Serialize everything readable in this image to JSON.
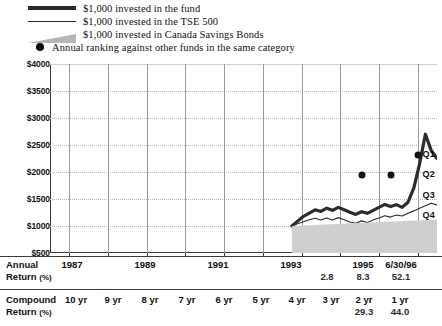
{
  "legend": {
    "items": [
      {
        "icon": "thick-line-swatch",
        "label": "$1,000 invested in the fund"
      },
      {
        "icon": "thin-line-swatch",
        "label": "$1,000 invested in the TSE 500"
      },
      {
        "icon": "gray-wedge-swatch",
        "label": "$1,000 invested in Canada Savings Bonds"
      },
      {
        "icon": "black-dot-swatch",
        "label": "Annual ranking against other funds in the same category"
      }
    ]
  },
  "chart_data": {
    "type": "line",
    "title": "",
    "xlabel": "",
    "ylabel": "",
    "ylim": [
      500,
      4000
    ],
    "yticks": [
      "$500",
      "$1000",
      "$1500",
      "$2000",
      "$2500",
      "$3000",
      "$3500",
      "$4000"
    ],
    "ytick_values": [
      500,
      1000,
      1500,
      2000,
      2500,
      3000,
      3500,
      4000
    ],
    "grid": true,
    "legend_position": "top",
    "xlim": [
      1986.5,
      1996.5
    ],
    "xticks": [
      1987,
      1988,
      1989,
      1990,
      1991,
      1992,
      1993,
      1994,
      1995,
      1996
    ],
    "xtick_labels": [
      "1987",
      "",
      "1989",
      "",
      "1991",
      "",
      "1993",
      "",
      "1995",
      "6/30/96"
    ],
    "series": [
      {
        "name": "$1,000 invested in the fund",
        "color": "#2b2b2b",
        "style": "thick",
        "x": [
          1992.75,
          1992.9,
          1993.05,
          1993.2,
          1993.35,
          1993.5,
          1993.65,
          1993.8,
          1993.95,
          1994.1,
          1994.25,
          1994.4,
          1994.55,
          1994.7,
          1994.85,
          1995.0,
          1995.15,
          1995.3,
          1995.45,
          1995.6,
          1995.75,
          1995.9,
          1996.05,
          1996.2,
          1996.35,
          1996.5
        ],
        "values": [
          1000,
          1090,
          1180,
          1240,
          1300,
          1270,
          1330,
          1290,
          1345,
          1300,
          1255,
          1215,
          1265,
          1235,
          1290,
          1345,
          1400,
          1360,
          1395,
          1345,
          1440,
          1700,
          2150,
          2700,
          2400,
          2250
        ]
      },
      {
        "name": "$1,000 invested in the TSE 500",
        "color": "#2b2b2b",
        "style": "thin",
        "x": [
          1992.75,
          1992.9,
          1993.05,
          1993.2,
          1993.35,
          1993.5,
          1993.65,
          1993.8,
          1993.95,
          1994.1,
          1994.25,
          1994.4,
          1994.55,
          1994.7,
          1994.85,
          1995.0,
          1995.15,
          1995.3,
          1995.45,
          1995.6,
          1995.75,
          1995.9,
          1996.05,
          1996.2,
          1996.35,
          1996.5
        ],
        "values": [
          1000,
          1040,
          1080,
          1115,
          1145,
          1110,
          1150,
          1110,
          1155,
          1115,
          1075,
          1050,
          1095,
          1065,
          1110,
          1150,
          1190,
          1165,
          1205,
          1185,
          1235,
          1280,
          1330,
          1375,
          1420,
          1390
        ]
      },
      {
        "name": "$1,000 invested in Canada Savings Bonds",
        "color": "#cfcfcf",
        "style": "area",
        "x": [
          1992.75,
          1996.5
        ],
        "values": [
          1000,
          1120
        ]
      }
    ],
    "rankings": {
      "name": "Annual ranking against other funds in the same category",
      "quartile_labels": [
        "Q1",
        "Q2",
        "Q3",
        "Q4"
      ],
      "points": [
        {
          "x": 1994.55,
          "quartile": "Q2"
        },
        {
          "x": 1995.3,
          "quartile": "Q2"
        },
        {
          "x": 1996.0,
          "quartile": "Q1"
        }
      ]
    }
  },
  "tables": {
    "annual": {
      "row_label_line1": "Annual",
      "row_label_line2": "Return",
      "row_label_unit": "(%)",
      "columns": [
        {
          "header": "1987",
          "value": ""
        },
        {
          "header": "1989",
          "value": ""
        },
        {
          "header": "1991",
          "value": ""
        },
        {
          "header": "1993",
          "value": ""
        },
        {
          "header": "",
          "value": "2.8"
        },
        {
          "header": "1995",
          "value": "8.3"
        },
        {
          "header": "6/30/96",
          "value": "52.1"
        }
      ]
    },
    "compound": {
      "row_label_line1": "Compound",
      "row_label_line2": "Return",
      "row_label_unit": "(%)",
      "columns": [
        {
          "header": "10 yr",
          "value": ""
        },
        {
          "header": "9 yr",
          "value": ""
        },
        {
          "header": "8 yr",
          "value": ""
        },
        {
          "header": "7 yr",
          "value": ""
        },
        {
          "header": "6 yr",
          "value": ""
        },
        {
          "header": "5 yr",
          "value": ""
        },
        {
          "header": "4 yr",
          "value": ""
        },
        {
          "header": "3 yr",
          "value": ""
        },
        {
          "header": "2 yr",
          "value": "29.3"
        },
        {
          "header": "1 yr",
          "value": "44.0"
        }
      ]
    }
  }
}
